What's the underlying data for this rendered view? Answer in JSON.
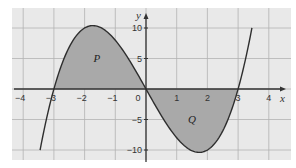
{
  "chart_data": {
    "type": "line",
    "title": "",
    "function": "y = x^3 - 9x",
    "xlabel": "x",
    "ylabel": "y",
    "xlim": [
      -4.4,
      4.6
    ],
    "ylim": [
      -13.3,
      13.3
    ],
    "x_range_of_curve": [
      -3.45,
      3.45
    ],
    "x_ticks": [
      -4,
      -3,
      -2,
      -1,
      0,
      1,
      2,
      3,
      4
    ],
    "x_tick_labels": [
      "−4",
      "−3",
      "−2",
      "−1",
      "0",
      "1",
      "2",
      "3",
      "4"
    ],
    "y_ticks": [
      -10,
      -5,
      5,
      10
    ],
    "y_tick_labels": [
      "−10",
      "−5",
      "5",
      "10"
    ],
    "grid": true,
    "grid_x": [
      -4,
      -3,
      -2,
      -1,
      0,
      1,
      2,
      3,
      4
    ],
    "grid_y": [
      -10,
      -5,
      0,
      5,
      10
    ],
    "shaded_regions": [
      {
        "name": "P",
        "from": -3,
        "to": 0,
        "label_at": [
          -1.6,
          4.5
        ]
      },
      {
        "name": "Q",
        "from": 0,
        "to": 3,
        "label_at": [
          1.5,
          -5.5
        ]
      }
    ],
    "colors": {
      "background": "#e9e9e9",
      "grid": "#b3b3b3",
      "shade": "#a9a9a9",
      "curve": "#2e2e2e",
      "axes": "#333333"
    }
  }
}
